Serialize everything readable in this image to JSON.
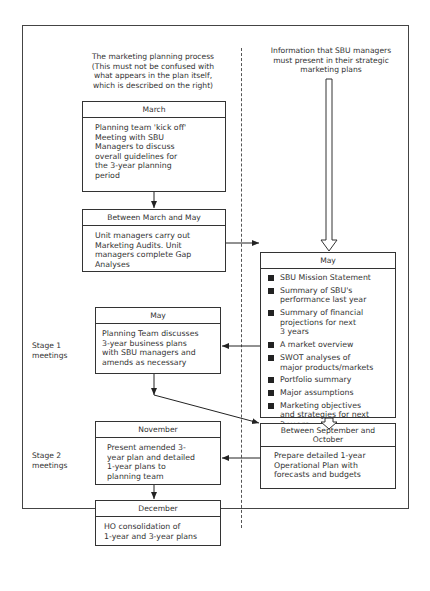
{
  "left_caption": {
    "lines": [
      "The marketing planning process",
      "(This must not be confused with",
      "what appears in the plan itself,",
      "which is described on the right)"
    ]
  },
  "right_caption": {
    "lines": [
      "Information that SBU managers",
      "must present in their strategic",
      "marketing plans"
    ]
  },
  "stages": {
    "stage1": [
      "Stage 1",
      "meetings"
    ],
    "stage2": [
      "Stage 2",
      "meetings"
    ]
  },
  "boxes": {
    "march": {
      "header": "March",
      "body": [
        "Planning team 'kick off'",
        "Meeting with SBU",
        "Managers to discuss",
        "overall guidelines for",
        "the 3-year planning",
        "period"
      ]
    },
    "march_may": {
      "header": "Between March and May",
      "body": [
        "Unit managers carry out",
        "Marketing Audits. Unit",
        "managers complete Gap",
        "Analyses"
      ]
    },
    "may_left": {
      "header": "May",
      "body": [
        "Planning Team discusses",
        "3-year business plans",
        "with SBU managers and",
        "amends as necessary"
      ]
    },
    "november": {
      "header": "November",
      "body": [
        "Present amended 3-",
        "year plan and detailed",
        "1-year plans to",
        "planning team"
      ]
    },
    "december": {
      "header": "December",
      "body": [
        "HO consolidation of",
        "1-year and 3-year plans"
      ]
    },
    "may_right": {
      "header": "May",
      "items": [
        [
          "SBU Mission Statement"
        ],
        [
          "Summary of SBU's",
          "performance last year"
        ],
        [
          "Summary of financial",
          "projections for next",
          "3 years"
        ],
        [
          "A market overview"
        ],
        [
          "SWOT analyses of",
          "major products/markets"
        ],
        [
          "Portfolio summary"
        ],
        [
          "Major assumptions"
        ],
        [
          "Marketing objectives",
          "and strategies for next",
          "3 years"
        ],
        [
          "Financial projections",
          "for next 3 years"
        ]
      ]
    },
    "sep_oct": {
      "header": [
        "Between September and",
        "October"
      ],
      "body": [
        "Prepare detailed 1-year",
        "Operational Plan with",
        "forecasts and budgets"
      ]
    }
  }
}
